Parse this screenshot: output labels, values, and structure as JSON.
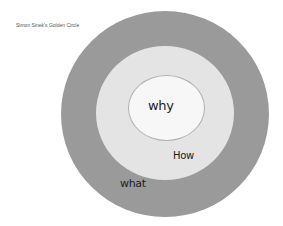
{
  "title": "Simon Sinek's Golden Circle",
  "rings": {
    "outer": {
      "label": "what",
      "color": "#9a9a9a"
    },
    "middle": {
      "label": "How",
      "color": "#e4e4e4"
    },
    "inner": {
      "label": "why",
      "color": "#f7f7f7"
    }
  }
}
